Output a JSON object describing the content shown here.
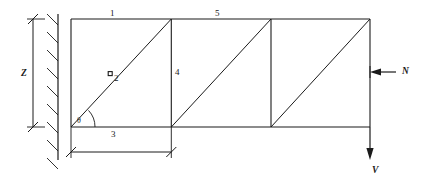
{
  "diagram": {
    "stroke_color": "#1a1a1a",
    "background_color": "#ffffff",
    "member_labels": [
      {
        "id": "member-1",
        "text": "1",
        "x": 110,
        "y": 9,
        "role": "top-chord-first-bay"
      },
      {
        "id": "member-2",
        "text": "2",
        "x": 114,
        "y": 74,
        "role": "diagonal-first-bay"
      },
      {
        "id": "member-3",
        "text": "3",
        "x": 111,
        "y": 130,
        "role": "bottom-chord-first-bay"
      },
      {
        "id": "member-4",
        "text": "4",
        "x": 175,
        "y": 68,
        "role": "vertical-post-first"
      },
      {
        "id": "member-5",
        "text": "5",
        "x": 215,
        "y": 9,
        "role": "top-chord-second-bay"
      }
    ],
    "dimension_labels": [
      {
        "id": "dim-z",
        "text": "Z",
        "x": 21,
        "y": 69,
        "role": "height-dimension"
      }
    ],
    "angle_labels": [
      {
        "id": "angle-theta",
        "text": "θ",
        "x": 77,
        "y": 117,
        "role": "diagonal-inclination-angle"
      }
    ],
    "load_labels": [
      {
        "id": "load-n",
        "text": "N",
        "x": 402,
        "y": 67,
        "role": "axial-load-horizontal"
      },
      {
        "id": "load-v",
        "text": "V",
        "x": 372,
        "y": 166,
        "role": "shear-load-vertical"
      }
    ],
    "geometry": {
      "wall_x": 58,
      "frame_left_x": 71,
      "frame_right_x": 370,
      "top_chord_y": 19,
      "bottom_chord_y": 127,
      "bay_width": 99.7,
      "post_x_values": [
        171.3,
        271.0,
        370.0
      ],
      "node_marker": {
        "x": 110,
        "y": 73.6,
        "size": 4
      },
      "z_dimension_x": 33,
      "base_dimension_y": 152,
      "base_dimension_x1": 71,
      "base_dimension_x2": 171.3,
      "hatch_count": 8,
      "hatch_top_y": 14,
      "hatch_bottom_y": 160
    }
  }
}
